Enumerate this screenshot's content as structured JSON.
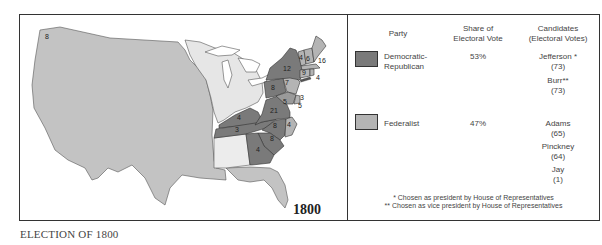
{
  "map": {
    "year_label": "1800",
    "caption": "ELECTION OF 1800",
    "colors": {
      "democratic_republican": "#7a7a7a",
      "federalist": "#b4b4b4",
      "territory": "#c6c6c6",
      "unorganized": "#e8e8e8"
    },
    "state_votes": [
      {
        "state": "NH-region",
        "votes": "4"
      },
      {
        "state": "VT/NH",
        "votes": "6"
      },
      {
        "state": "MA",
        "votes": "16"
      },
      {
        "state": "CT/RI",
        "votes": "9"
      },
      {
        "state": "RI",
        "votes": "4"
      },
      {
        "state": "NY",
        "votes": "12"
      },
      {
        "state": "NJ",
        "votes": "7"
      },
      {
        "state": "PA",
        "votes": "8"
      },
      {
        "state": "DE",
        "votes": "3"
      },
      {
        "state": "MD",
        "votes": "5"
      },
      {
        "state": "MD-split",
        "votes": "5"
      },
      {
        "state": "VA",
        "votes": "21"
      },
      {
        "state": "KY",
        "votes": "4"
      },
      {
        "state": "TN",
        "votes": "3"
      },
      {
        "state": "NC-dr",
        "votes": "8"
      },
      {
        "state": "NC-fed",
        "votes": "4"
      },
      {
        "state": "SC",
        "votes": "8"
      },
      {
        "state": "GA",
        "votes": "4"
      },
      {
        "state": "OR-corner",
        "votes": "8"
      }
    ]
  },
  "legend": {
    "headers": {
      "party": "Party",
      "share": "Share of Electoral Vote",
      "share_line1": "Share of",
      "share_line2": "Electoral Vote",
      "candidates_line1": "Candidates",
      "candidates_line2": "(Electoral Votes)"
    },
    "parties": [
      {
        "name_line1": "Democratic-",
        "name_line2": "Republican",
        "share": "53%",
        "color": "#7a7a7a",
        "candidates": [
          {
            "name": "Jefferson *",
            "votes": "(73)"
          },
          {
            "name": "Burr**",
            "votes": "(73)"
          }
        ]
      },
      {
        "name_line1": "Federalist",
        "name_line2": "",
        "share": "47%",
        "color": "#b4b4b4",
        "candidates": [
          {
            "name": "Adams",
            "votes": "(65)"
          },
          {
            "name": "Pinckney",
            "votes": "(64)"
          },
          {
            "name": "Jay",
            "votes": "(1)"
          }
        ]
      }
    ],
    "footnotes": [
      "* Chosen as president by House of Representatives",
      "** Chosen as vice president by House of Representatives"
    ]
  }
}
